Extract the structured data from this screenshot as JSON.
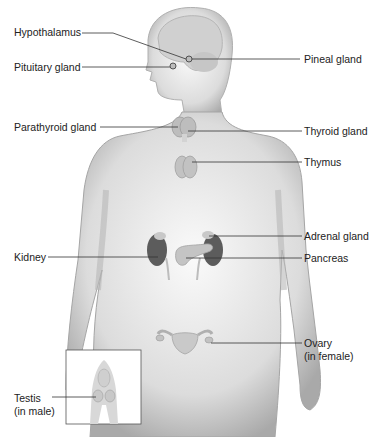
{
  "diagram": {
    "labels_left": [
      {
        "id": "hypothalamus",
        "text": "Hypothalamus"
      },
      {
        "id": "pituitary",
        "text": "Pituitary gland"
      },
      {
        "id": "parathyroid",
        "text": "Parathyroid gland"
      },
      {
        "id": "kidney",
        "text": "Kidney"
      },
      {
        "id": "testis",
        "text": "Testis",
        "sub": "(in male)"
      }
    ],
    "labels_right": [
      {
        "id": "pineal",
        "text": "Pineal gland"
      },
      {
        "id": "thyroid",
        "text": "Thyroid gland"
      },
      {
        "id": "thymus",
        "text": "Thymus"
      },
      {
        "id": "adrenal",
        "text": "Adrenal gland"
      },
      {
        "id": "pancreas",
        "text": "Pancreas"
      },
      {
        "id": "ovary",
        "text": "Ovary",
        "sub": "(in female)"
      }
    ],
    "colors": {
      "body": "#d9d9d9",
      "body_edge": "#a8a8a8",
      "organ": "#bdbdbd",
      "kidney": "#5a5a5a",
      "line": "#333333"
    }
  }
}
